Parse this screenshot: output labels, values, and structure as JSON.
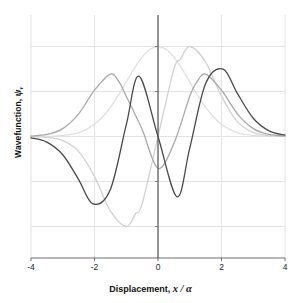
{
  "chart_data": {
    "type": "line",
    "title": "",
    "xlabel": "Displacement, x / α",
    "ylabel": "Wavefunction, ψ",
    "ylabel_sub": "v",
    "xlabel_text": "Displacement,",
    "xlabel_var": "x",
    "xlabel_rest": "/ α",
    "ylabel_text": "Wavefunction,",
    "ylabel_var": "ψ",
    "xlim": [
      -4,
      4
    ],
    "ylim": [
      -1.35,
      1.35
    ],
    "xticks": [
      "-4",
      "-2",
      "0",
      "2",
      "4"
    ],
    "xtick_values": [
      -4,
      -2,
      0,
      2,
      4
    ],
    "ytick_values": [
      -1.0,
      -0.5,
      0.0,
      0.5,
      1.0
    ],
    "yticklabels": [
      "",
      "",
      "",
      "",
      ""
    ],
    "grid": true,
    "grid_color": "#e3e3e3",
    "axis_color": "#6f6f6f",
    "legend": "none",
    "series": [
      {
        "name": "v = 0",
        "color": "#e0e0e0",
        "quantum_number": 0,
        "x": [
          -4,
          -3.75,
          -3.5,
          -3.25,
          -3,
          -2.75,
          -2.5,
          -2.25,
          -2,
          -1.75,
          -1.5,
          -1.25,
          -1,
          -0.75,
          -0.5,
          -0.25,
          0,
          0.25,
          0.5,
          0.75,
          1,
          1.25,
          1.5,
          1.75,
          2,
          2.25,
          2.5,
          2.75,
          3,
          3.25,
          3.5,
          3.75,
          4
        ],
        "values": [
          0.0003,
          0.0009,
          0.0022,
          0.0051,
          0.0111,
          0.0228,
          0.0439,
          0.0796,
          0.1353,
          0.2163,
          0.3247,
          0.4578,
          0.6065,
          0.7548,
          0.8825,
          0.9692,
          1.0,
          0.9692,
          0.8825,
          0.7548,
          0.6065,
          0.4578,
          0.3247,
          0.2163,
          0.1353,
          0.0796,
          0.0439,
          0.0228,
          0.0111,
          0.0051,
          0.0022,
          0.0009,
          0.0003
        ]
      },
      {
        "name": "v = 1",
        "color": "#d2d2d2",
        "quantum_number": 1,
        "x": [
          -4,
          -3.5,
          -3,
          -2.5,
          -2,
          -1.5,
          -1,
          -0.7071,
          -0.5,
          0,
          0.5,
          0.7071,
          1,
          1.5,
          2,
          2.5,
          3,
          3.5,
          4
        ],
        "values": [
          -0.0015,
          -0.0091,
          -0.0452,
          -0.166,
          -0.4462,
          -0.8268,
          -1.0,
          -0.8578,
          -0.7488,
          0.0,
          0.7488,
          0.8578,
          1.0,
          0.8268,
          0.4462,
          0.166,
          0.0452,
          0.0091,
          0.0015
        ]
      },
      {
        "name": "v = 2",
        "color": "#a8a8a8",
        "quantum_number": 2,
        "x": [
          -4,
          -3.5,
          -3,
          -2.5,
          -2,
          -1.5,
          -1.2247,
          -1,
          -0.5,
          0,
          0.5,
          1,
          1.2247,
          1.5,
          2,
          2.5,
          3,
          3.5,
          4
        ],
        "values": [
          0.0046,
          0.0226,
          0.0878,
          0.2521,
          0.5144,
          0.6935,
          0.6065,
          0.4463,
          0.0772,
          -0.3536,
          -0.0772,
          0.4463,
          0.6065,
          0.6935,
          0.5144,
          0.2521,
          0.0878,
          0.0226,
          0.0046
        ]
      },
      {
        "name": "v = 3",
        "color": "#4a4a4a",
        "quantum_number": 3,
        "x": [
          -4,
          -3.5,
          -3,
          -2.5,
          -2.05,
          -1.5,
          -1,
          -0.6,
          0,
          0.6,
          1,
          1.5,
          2.05,
          2.5,
          3,
          3.5,
          4
        ],
        "values": [
          -0.0148,
          -0.0623,
          -0.203,
          -0.4783,
          -0.749,
          -0.588,
          0.1283,
          0.67,
          0.0,
          -0.67,
          -0.1283,
          0.588,
          0.749,
          0.4783,
          0.203,
          0.0623,
          0.0148
        ]
      }
    ]
  },
  "axis": {
    "xticklabels": [
      "-4",
      "-2",
      "0",
      "2",
      "4"
    ]
  }
}
